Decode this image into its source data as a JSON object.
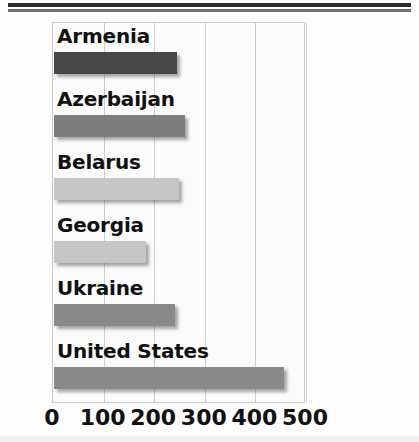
{
  "chart_data": {
    "type": "bar",
    "orientation": "horizontal",
    "title": "",
    "subtitle": "",
    "xlabel": "",
    "ylabel": "",
    "categories": [
      "Armenia",
      "Azerbaijan",
      "Belarus",
      "Georgia",
      "Ukraine",
      "United States"
    ],
    "values": [
      243,
      259,
      248,
      182,
      240,
      455
    ],
    "xlim": [
      0,
      500
    ],
    "xticks": [
      0,
      100,
      200,
      300,
      400,
      500
    ],
    "xtick_labels": [
      "0",
      "100",
      "200",
      "300",
      "400",
      "500"
    ],
    "grid": true,
    "grid_axis": "x",
    "legend": false,
    "legend_position": "none",
    "bar_colors": [
      "#474747",
      "#7d7d7d",
      "#c6c6c6",
      "#c6c6c6",
      "#8a8a8a",
      "#8a8a8a"
    ]
  },
  "bars": [
    {
      "label": "Armenia",
      "value": 243,
      "color": "#474747"
    },
    {
      "label": "Azerbaijan",
      "value": 259,
      "color": "#7d7d7d"
    },
    {
      "label": "Belarus",
      "value": 248,
      "color": "#c6c6c6"
    },
    {
      "label": "Georgia",
      "value": 182,
      "color": "#c6c6c6"
    },
    {
      "label": "Ukraine",
      "value": 240,
      "color": "#8a8a8a"
    },
    {
      "label": "United States",
      "value": 455,
      "color": "#8a8a8a"
    }
  ],
  "axis": {
    "ticks": [
      {
        "label": "0",
        "value": 0
      },
      {
        "label": "100",
        "value": 100
      },
      {
        "label": "200",
        "value": 200
      },
      {
        "label": "300",
        "value": 300
      },
      {
        "label": "400",
        "value": 400
      },
      {
        "label": "500",
        "value": 500
      }
    ]
  }
}
